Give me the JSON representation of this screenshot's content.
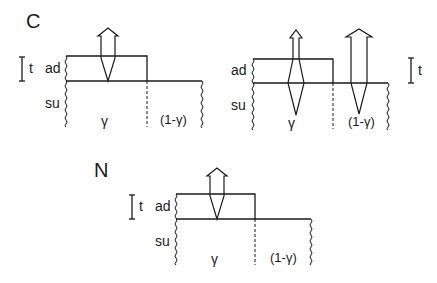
{
  "diagram": {
    "panels": [
      {
        "id": "C",
        "label": "C",
        "layer_labels": {
          "adsorbate": "ad",
          "substrate": "su",
          "thickness": "t"
        },
        "region_labels": {
          "covered": "γ",
          "uncovered": "(1-γ)"
        },
        "arrows": [
          {
            "region": "covered",
            "type": "narrow-through-adlayer"
          }
        ]
      },
      {
        "id": "C-right",
        "label": "",
        "layer_labels": {
          "adsorbate": "ad",
          "substrate": "su",
          "thickness": "t"
        },
        "region_labels": {
          "covered": "γ",
          "uncovered": "(1-γ)"
        },
        "arrows": [
          {
            "region": "covered",
            "type": "diamond-into-substrate"
          },
          {
            "region": "uncovered",
            "type": "wide-into-substrate"
          }
        ]
      },
      {
        "id": "N",
        "label": "N",
        "layer_labels": {
          "adsorbate": "ad",
          "substrate": "su",
          "thickness": "t"
        },
        "region_labels": {
          "covered": "γ",
          "uncovered": "(1-γ)"
        },
        "arrows": [
          {
            "region": "covered",
            "type": "narrow-through-adlayer"
          }
        ]
      }
    ],
    "colors": {
      "line": "#1a1a1a",
      "background": "#ffffff"
    }
  }
}
